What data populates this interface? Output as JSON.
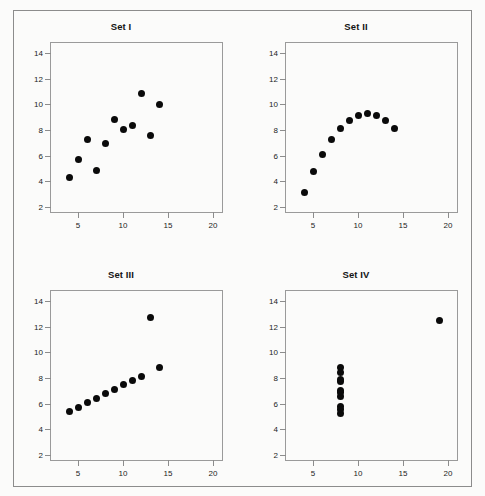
{
  "figure": {
    "background_color": "#fbfbfa",
    "frame_color": "#8c8c8c",
    "marker_color": "#0a0a0a",
    "axis_color": "#9a9a9a",
    "text_color": "#1c1c1c"
  },
  "chart_data": [
    {
      "type": "scatter",
      "title": "Set I",
      "xlabel": "",
      "ylabel": "",
      "xlim": [
        2,
        21
      ],
      "ylim": [
        1.6,
        14.8
      ],
      "xticks": [
        5,
        10,
        15,
        20
      ],
      "yticks": [
        2,
        4,
        6,
        8,
        10,
        12,
        14
      ],
      "grid": false,
      "legend": "none",
      "x": [
        10,
        8,
        13,
        9,
        11,
        14,
        6,
        4,
        12,
        7,
        5
      ],
      "y": [
        8.04,
        6.95,
        7.58,
        8.81,
        8.33,
        9.96,
        7.24,
        4.26,
        10.84,
        4.82,
        5.68
      ]
    },
    {
      "type": "scatter",
      "title": "Set II",
      "xlabel": "",
      "ylabel": "",
      "xlim": [
        2,
        21
      ],
      "ylim": [
        1.6,
        14.8
      ],
      "xticks": [
        5,
        10,
        15,
        20
      ],
      "yticks": [
        2,
        4,
        6,
        8,
        10,
        12,
        14
      ],
      "grid": false,
      "legend": "none",
      "x": [
        10,
        8,
        13,
        9,
        11,
        14,
        6,
        4,
        12,
        7,
        5
      ],
      "y": [
        9.14,
        8.14,
        8.74,
        8.77,
        9.26,
        8.1,
        6.13,
        3.1,
        9.13,
        7.26,
        4.74
      ]
    },
    {
      "type": "scatter",
      "title": "Set III",
      "xlabel": "",
      "ylabel": "",
      "xlim": [
        2,
        21
      ],
      "ylim": [
        1.6,
        14.8
      ],
      "xticks": [
        5,
        10,
        15,
        20
      ],
      "yticks": [
        2,
        4,
        6,
        8,
        10,
        12,
        14
      ],
      "grid": false,
      "legend": "none",
      "x": [
        10,
        8,
        13,
        9,
        11,
        14,
        6,
        4,
        12,
        7,
        5
      ],
      "y": [
        7.46,
        6.77,
        12.74,
        7.11,
        7.81,
        8.84,
        6.08,
        5.39,
        8.15,
        6.42,
        5.73
      ]
    },
    {
      "type": "scatter",
      "title": "Set IV",
      "xlabel": "",
      "ylabel": "",
      "xlim": [
        2,
        21
      ],
      "ylim": [
        1.6,
        14.8
      ],
      "xticks": [
        5,
        10,
        15,
        20
      ],
      "yticks": [
        2,
        4,
        6,
        8,
        10,
        12,
        14
      ],
      "grid": false,
      "legend": "none",
      "x": [
        8,
        8,
        8,
        8,
        8,
        8,
        8,
        19,
        8,
        8,
        8
      ],
      "y": [
        6.58,
        5.76,
        7.71,
        8.84,
        8.47,
        7.04,
        5.25,
        12.5,
        5.56,
        7.91,
        6.89
      ]
    }
  ]
}
